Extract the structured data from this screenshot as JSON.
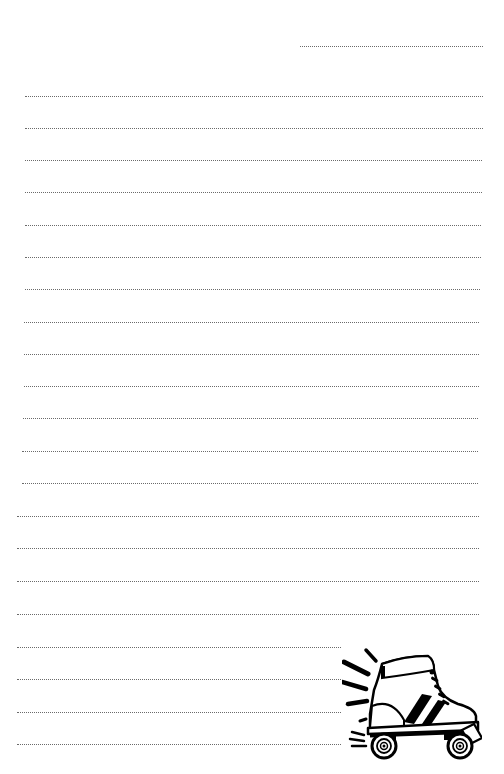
{
  "document": {
    "type": "lined-notepaper",
    "background_color": "#ffffff",
    "line_color": "#6a6a6a",
    "line_style": "dotted",
    "date_line": {
      "x1": 300,
      "x2": 483,
      "y": 46,
      "text": ""
    },
    "lines": [
      {
        "y": 96,
        "x1": 25,
        "x2": 483,
        "text": ""
      },
      {
        "y": 128,
        "x1": 25,
        "x2": 483,
        "text": ""
      },
      {
        "y": 160,
        "x1": 25,
        "x2": 482,
        "text": ""
      },
      {
        "y": 192,
        "x1": 25,
        "x2": 482,
        "text": ""
      },
      {
        "y": 225,
        "x1": 25,
        "x2": 481,
        "text": ""
      },
      {
        "y": 257,
        "x1": 25,
        "x2": 481,
        "text": ""
      },
      {
        "y": 289,
        "x1": 25,
        "x2": 480,
        "text": ""
      },
      {
        "y": 322,
        "x1": 24,
        "x2": 479,
        "text": ""
      },
      {
        "y": 354,
        "x1": 24,
        "x2": 479,
        "text": ""
      },
      {
        "y": 386,
        "x1": 24,
        "x2": 479,
        "text": ""
      },
      {
        "y": 418,
        "x1": 23,
        "x2": 478,
        "text": ""
      },
      {
        "y": 451,
        "x1": 22,
        "x2": 478,
        "text": ""
      },
      {
        "y": 483,
        "x1": 22,
        "x2": 478,
        "text": ""
      },
      {
        "y": 516,
        "x1": 17,
        "x2": 479,
        "text": ""
      },
      {
        "y": 548,
        "x1": 17,
        "x2": 479,
        "text": ""
      },
      {
        "y": 581,
        "x1": 17,
        "x2": 479,
        "text": ""
      },
      {
        "y": 614,
        "x1": 17,
        "x2": 479,
        "text": ""
      },
      {
        "y": 647,
        "x1": 17,
        "x2": 479,
        "text": ""
      },
      {
        "y": 679,
        "x1": 17,
        "x2": 479,
        "text": ""
      },
      {
        "y": 712,
        "x1": 17,
        "x2": 479,
        "text": ""
      },
      {
        "y": 744,
        "x1": 17,
        "x2": 479,
        "text": ""
      }
    ]
  },
  "illustration": {
    "icon": "roller-skate-icon",
    "position": "bottom-right",
    "stroke_color": "#000000",
    "fill_color": "#ffffff"
  }
}
